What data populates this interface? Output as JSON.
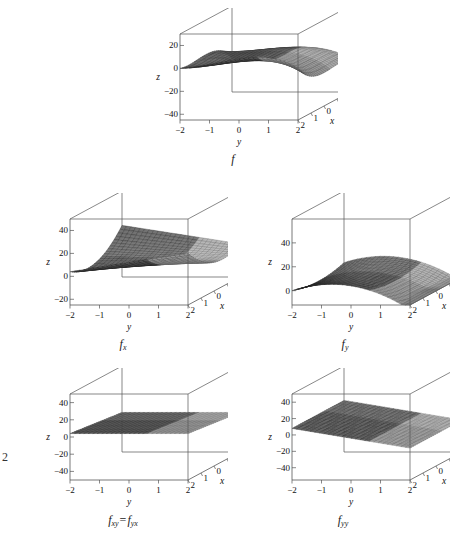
{
  "figure": {
    "background": "#ffffff",
    "stray_mark": "2",
    "box_color": "#555555",
    "mesh_color": "#202020",
    "panels": [
      {
        "id": "f",
        "caption_f": "f",
        "caption_sub": "",
        "function": "f",
        "axes": {
          "z_label": "z",
          "y_label": "y",
          "x_label": "x",
          "z_ticks": [
            "20",
            "0",
            "-20",
            "-40"
          ],
          "z_tick_values": [
            20,
            0,
            -20,
            -40
          ],
          "y_ticks": [
            "-2",
            "-1",
            "0",
            "1",
            "2"
          ],
          "y_tick_values": [
            -2,
            -1,
            0,
            1,
            2
          ],
          "x_ticks": [
            "2",
            "1",
            "0",
            "-1",
            "-2"
          ],
          "x_tick_values": [
            2,
            1,
            0,
            -1,
            -2
          ],
          "zlim": [
            -45,
            30
          ]
        }
      },
      {
        "id": "fx",
        "caption_f": "f",
        "caption_sub": "x",
        "function": "fx",
        "axes": {
          "z_label": "z",
          "y_label": "y",
          "x_label": "x",
          "z_ticks": [
            "40",
            "20",
            "0",
            "-20"
          ],
          "z_tick_values": [
            40,
            20,
            0,
            -20
          ],
          "y_ticks": [
            "-2",
            "-1",
            "0",
            "1",
            "2"
          ],
          "y_tick_values": [
            -2,
            -1,
            0,
            1,
            2
          ],
          "x_ticks": [
            "2",
            "1",
            "0",
            "-1",
            "-2"
          ],
          "x_tick_values": [
            2,
            1,
            0,
            -1,
            -2
          ],
          "zlim": [
            -25,
            50
          ]
        }
      },
      {
        "id": "fy",
        "caption_f": "f",
        "caption_sub": "y",
        "function": "fy",
        "axes": {
          "z_label": "z",
          "y_label": "y",
          "x_label": "x",
          "z_ticks": [
            "40",
            "20",
            "0"
          ],
          "z_tick_values": [
            40,
            20,
            0
          ],
          "y_ticks": [
            "-2",
            "-1",
            "0",
            "1",
            "2"
          ],
          "y_tick_values": [
            -2,
            -1,
            0,
            1,
            2
          ],
          "x_ticks": [
            "2",
            "1",
            "0",
            "-1",
            "-2"
          ],
          "x_tick_values": [
            2,
            1,
            0,
            -1,
            -2
          ],
          "zlim": [
            -12,
            60
          ]
        }
      },
      {
        "id": "fxy",
        "caption_f": "f",
        "caption_sub": "xy",
        "caption_eq": "=",
        "caption_f2": "f",
        "caption_sub2": "yx",
        "function": "fxy",
        "axes": {
          "z_label": "z",
          "y_label": "y",
          "x_label": "x",
          "z_ticks": [
            "40",
            "20",
            "0",
            "-20",
            "-40"
          ],
          "z_tick_values": [
            40,
            20,
            0,
            -20,
            -40
          ],
          "y_ticks": [
            "-2",
            "-1",
            "0",
            "1",
            "2"
          ],
          "y_tick_values": [
            -2,
            -1,
            0,
            1,
            2
          ],
          "x_ticks": [
            "2",
            "1",
            "0",
            "-1",
            "-2"
          ],
          "x_tick_values": [
            2,
            1,
            0,
            -1,
            -2
          ],
          "zlim": [
            -50,
            50
          ]
        }
      },
      {
        "id": "fyy",
        "caption_f": "f",
        "caption_sub": "yy",
        "function": "fyy",
        "axes": {
          "z_label": "z",
          "y_label": "y",
          "x_label": "x",
          "z_ticks": [
            "40",
            "20",
            "0",
            "-20",
            "-40"
          ],
          "z_tick_values": [
            40,
            20,
            0,
            -20,
            -40
          ],
          "y_ticks": [
            "-2",
            "-1",
            "0",
            "1",
            "2"
          ],
          "y_tick_values": [
            -2,
            -1,
            0,
            1,
            2
          ],
          "x_ticks": [
            "2",
            "1",
            "0",
            "-1",
            "-2"
          ],
          "x_tick_values": [
            2,
            1,
            0,
            -1,
            -2
          ],
          "zlim": [
            -55,
            50
          ]
        }
      }
    ]
  },
  "chart_data": {
    "type": "surface",
    "title": "",
    "domain": {
      "x": [
        -2,
        2
      ],
      "y": [
        -2,
        2
      ]
    },
    "xlabel": "x",
    "ylabel": "y",
    "zlabel": "z",
    "grid": true,
    "legend": "none",
    "surfaces": [
      {
        "name": "f",
        "label": "f",
        "expression": "x^3 + x^2*y - 2*y^2 - y^3",
        "zlim": [
          -45,
          30
        ],
        "z_ticks": [
          20,
          0,
          -20,
          -40
        ],
        "x_ticks": [
          2,
          1,
          0,
          -1,
          -2
        ],
        "y_ticks": [
          -2,
          -1,
          0,
          1,
          2
        ],
        "corner_values": {
          "x_-2_y_-2": 8,
          "x_-2_y_2": -16,
          "x_2_y_-2": 24,
          "x_2_y_2": 0
        }
      },
      {
        "name": "fx",
        "label": "f_x",
        "expression": "3*x^2 + 2*x*y",
        "zlim": [
          -25,
          50
        ],
        "z_ticks": [
          40,
          20,
          0,
          -20
        ],
        "x_ticks": [
          2,
          1,
          0,
          -1,
          -2
        ],
        "y_ticks": [
          -2,
          -1,
          0,
          1,
          2
        ]
      },
      {
        "name": "fy",
        "label": "f_y",
        "expression": "x^2 - 4*y - 3*y^2",
        "zlim": [
          -12,
          60
        ],
        "z_ticks": [
          40,
          20,
          0
        ],
        "x_ticks": [
          2,
          1,
          0,
          -1,
          -2
        ],
        "y_ticks": [
          -2,
          -1,
          0,
          1,
          2
        ]
      },
      {
        "name": "fxy",
        "label": "f_xy = f_yx",
        "expression": "2*x",
        "zlim": [
          -50,
          50
        ],
        "z_ticks": [
          40,
          20,
          0,
          -20,
          -40
        ],
        "x_ticks": [
          2,
          1,
          0,
          -1,
          -2
        ],
        "y_ticks": [
          -2,
          -1,
          0,
          1,
          2
        ]
      },
      {
        "name": "fyy",
        "label": "f_yy",
        "expression": "-4 - 6*y",
        "zlim": [
          -55,
          50
        ],
        "z_ticks": [
          40,
          20,
          0,
          -20,
          -40
        ],
        "x_ticks": [
          2,
          1,
          0,
          -1,
          -2
        ],
        "y_ticks": [
          -2,
          -1,
          0,
          1,
          2
        ]
      }
    ]
  }
}
